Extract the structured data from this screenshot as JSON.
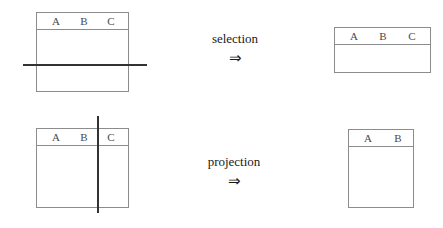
{
  "figure": {
    "background_color": "#ffffff",
    "line_color": "#8c8c8c",
    "rule_color": "#333333",
    "text_color": "#1a1a1a"
  },
  "rows": [
    {
      "id": "selection",
      "operator_label": "selection",
      "operator_arrow": "⇒",
      "input_table": {
        "columns": [
          "A",
          "B",
          "C"
        ],
        "marker": "horizontal-rule"
      },
      "output_table": {
        "columns": [
          "A",
          "B",
          "C"
        ],
        "marker": "none"
      }
    },
    {
      "id": "projection",
      "operator_label": "projection",
      "operator_arrow": "⇒",
      "input_table": {
        "columns": [
          "A",
          "B",
          "C"
        ],
        "marker": "vertical-rule"
      },
      "output_table": {
        "columns": [
          "A",
          "B"
        ],
        "marker": "none"
      }
    }
  ]
}
